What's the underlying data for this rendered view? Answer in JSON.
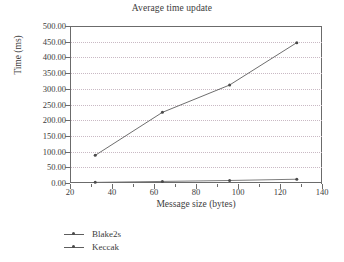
{
  "chart_data": {
    "type": "line",
    "title": "Average time update",
    "xlabel": "Message size (bytes)",
    "ylabel": "Time (ms)",
    "xlim": [
      20,
      140
    ],
    "ylim": [
      0,
      500
    ],
    "xticks": [
      "20",
      "40",
      "60",
      "80",
      "100",
      "120",
      "140"
    ],
    "xtick_values": [
      20,
      40,
      60,
      80,
      100,
      120,
      140
    ],
    "yticks": [
      "0.00",
      "50.00",
      "100.00",
      "150.00",
      "200.00",
      "250.00",
      "300.00",
      "350.00",
      "400.00",
      "450.00",
      "500.00"
    ],
    "ytick_values": [
      0,
      50,
      100,
      150,
      200,
      250,
      300,
      350,
      400,
      450,
      500
    ],
    "grid": "horizontal-dotted",
    "legend_position": "below-left",
    "x": [
      32,
      64,
      96,
      128
    ],
    "series": [
      {
        "name": "Blake2s",
        "values": [
          88,
          225,
          312,
          447
        ],
        "color": "#5d5d5d"
      },
      {
        "name": "Keccak",
        "values": [
          2,
          5,
          8,
          12
        ],
        "color": "#6e6e6e"
      }
    ]
  },
  "legend": {
    "items": [
      {
        "label": "Blake2s"
      },
      {
        "label": "Keccak"
      }
    ]
  }
}
